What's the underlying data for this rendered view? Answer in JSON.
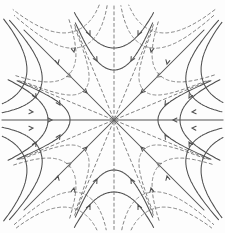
{
  "figure": {
    "name": "saddle-star-phase-portrait",
    "width": 225,
    "height": 233,
    "center": {
      "x": 114,
      "y": 120
    },
    "colors": {
      "background": "#fdfdfd",
      "solid": "#4f4f4f",
      "dashed": "#7b7b7b",
      "axis": "#8a8a8a"
    },
    "stroke": {
      "solid_width": 1.05,
      "dashed_width": 0.95,
      "axis_width": 1.35,
      "dash_pattern": "3,2.8",
      "arrow_len": 4.4,
      "arrow_half_angle": 27
    },
    "clip_box": {
      "x0": 2,
      "y0": 4,
      "x1": 223,
      "y1": 230
    },
    "straight_lines": [
      {
        "name": "horizontal-axis",
        "style": "axis",
        "x1": 2,
        "y1": 120,
        "x2": 223,
        "y2": 120
      },
      {
        "name": "diagonal-ne-sw",
        "style": "solid",
        "x1": 24,
        "y1": 210,
        "x2": 204,
        "y2": 30
      },
      {
        "name": "diagonal-nw-se",
        "style": "solid",
        "x1": 24,
        "y1": 30,
        "x2": 204,
        "y2": 210
      },
      {
        "name": "vertical-axis",
        "style": "dashed",
        "x1": 114,
        "y1": 6,
        "x2": 114,
        "y2": 230
      }
    ],
    "rays": [
      {
        "name": "ray-22p5",
        "angle": 22.5,
        "r": 103,
        "style": "dashed"
      },
      {
        "name": "ray-67p5",
        "angle": 67.5,
        "r": 103,
        "style": "dashed"
      },
      {
        "name": "ray-112p5",
        "angle": 112.5,
        "r": 103,
        "style": "dashed"
      },
      {
        "name": "ray-157p5",
        "angle": 157.5,
        "r": 103,
        "style": "dashed"
      }
    ],
    "span_deg": 22.35,
    "u_curves": [
      {
        "name": "solid-u-top",
        "dir": 90,
        "style": "solid",
        "vertices": [
          50,
          72
        ],
        "clip": 118
      },
      {
        "name": "solid-u-bottom",
        "dir": 270,
        "style": "solid",
        "vertices": [
          50,
          72
        ],
        "clip": 118
      },
      {
        "name": "solid-u-left",
        "dir": 180,
        "style": "solid",
        "vertices": [
          44,
          66
        ],
        "clip": 118
      },
      {
        "name": "solid-u-right",
        "dir": 0,
        "style": "solid",
        "vertices": [
          44,
          66
        ],
        "clip": 118
      },
      {
        "name": "dashed-u-ne",
        "dir": 45,
        "style": "dashed",
        "vertices": [
          42,
          64
        ],
        "clip": 112
      },
      {
        "name": "dashed-u-nw",
        "dir": 135,
        "style": "dashed",
        "vertices": [
          42,
          64
        ],
        "clip": 112
      },
      {
        "name": "dashed-u-sw",
        "dir": 225,
        "style": "dashed",
        "vertices": [
          42,
          64
        ],
        "clip": 112
      },
      {
        "name": "dashed-u-se",
        "dir": 315,
        "style": "dashed",
        "vertices": [
          42,
          64
        ],
        "clip": 112
      },
      {
        "name": "solid-bulge-e-ne",
        "dir": 22.5,
        "style": "solid",
        "vertices": [
          80,
          97
        ],
        "clip": 152
      },
      {
        "name": "solid-bulge-w-nw",
        "dir": 157.5,
        "style": "solid",
        "vertices": [
          80,
          97
        ],
        "clip": 152
      },
      {
        "name": "solid-bulge-w-sw",
        "dir": 202.5,
        "style": "solid",
        "vertices": [
          80,
          97
        ],
        "clip": 152
      },
      {
        "name": "solid-bulge-e-se",
        "dir": 337.5,
        "style": "solid",
        "vertices": [
          80,
          97
        ],
        "clip": 152
      },
      {
        "name": "dashed-bulge-n-ne",
        "dir": 67.5,
        "style": "dashed",
        "vertices": [
          80,
          97
        ],
        "clip": 152
      },
      {
        "name": "dashed-bulge-n-nw",
        "dir": 112.5,
        "style": "dashed",
        "vertices": [
          80,
          97
        ],
        "clip": 152
      },
      {
        "name": "dashed-bulge-s-sw",
        "dir": 247.5,
        "style": "dashed",
        "vertices": [
          80,
          97
        ],
        "clip": 152
      },
      {
        "name": "dashed-bulge-s-se",
        "dir": 292.5,
        "style": "dashed",
        "vertices": [
          80,
          97
        ],
        "clip": 152
      }
    ],
    "arrows": [
      {
        "x": 90,
        "y": 35,
        "a": 63,
        "style": "solid"
      },
      {
        "x": 138,
        "y": 35,
        "a": 117,
        "style": "solid"
      },
      {
        "x": 97,
        "y": 61,
        "a": 60,
        "style": "solid"
      },
      {
        "x": 131,
        "y": 61,
        "a": 120,
        "style": "solid"
      },
      {
        "x": 90,
        "y": 205,
        "a": 297,
        "style": "solid"
      },
      {
        "x": 138,
        "y": 205,
        "a": 243,
        "style": "solid"
      },
      {
        "x": 97,
        "y": 179,
        "a": 300,
        "style": "solid"
      },
      {
        "x": 131,
        "y": 179,
        "a": 240,
        "style": "solid"
      },
      {
        "x": 36,
        "y": 98,
        "a": 61,
        "style": "solid"
      },
      {
        "x": 36,
        "y": 142,
        "a": 299,
        "style": "solid"
      },
      {
        "x": 60,
        "y": 105,
        "a": 58,
        "style": "solid"
      },
      {
        "x": 60,
        "y": 135,
        "a": 302,
        "style": "solid"
      },
      {
        "x": 189,
        "y": 98,
        "a": 119,
        "style": "solid"
      },
      {
        "x": 189,
        "y": 142,
        "a": 241,
        "style": "solid"
      },
      {
        "x": 165,
        "y": 105,
        "a": 122,
        "style": "solid"
      },
      {
        "x": 165,
        "y": 135,
        "a": 238,
        "style": "solid"
      },
      {
        "x": 33,
        "y": 112,
        "a": 4,
        "style": "solid"
      },
      {
        "x": 33,
        "y": 128,
        "a": 356,
        "style": "solid"
      },
      {
        "x": 52,
        "y": 120,
        "a": 0,
        "style": "solid"
      },
      {
        "x": 192,
        "y": 112,
        "a": 176,
        "style": "solid"
      },
      {
        "x": 192,
        "y": 128,
        "a": 184,
        "style": "solid"
      },
      {
        "x": 173,
        "y": 120,
        "a": 180,
        "style": "solid"
      },
      {
        "x": 141,
        "y": 93,
        "a": 135,
        "style": "solid"
      },
      {
        "x": 87,
        "y": 93,
        "a": 45,
        "style": "solid"
      },
      {
        "x": 87,
        "y": 147,
        "a": 315,
        "style": "solid"
      },
      {
        "x": 141,
        "y": 147,
        "a": 225,
        "style": "solid"
      },
      {
        "x": 58,
        "y": 64,
        "a": 78,
        "style": "solid"
      },
      {
        "x": 74,
        "y": 52,
        "a": 78,
        "style": "solid"
      },
      {
        "x": 167,
        "y": 64,
        "a": 102,
        "style": "solid"
      },
      {
        "x": 151,
        "y": 52,
        "a": 102,
        "style": "solid"
      },
      {
        "x": 58,
        "y": 176,
        "a": 282,
        "style": "solid"
      },
      {
        "x": 74,
        "y": 188,
        "a": 282,
        "style": "solid"
      },
      {
        "x": 167,
        "y": 176,
        "a": 258,
        "style": "solid"
      },
      {
        "x": 151,
        "y": 188,
        "a": 258,
        "style": "solid"
      },
      {
        "x": 157,
        "y": 77,
        "a": 145,
        "style": "dashed"
      },
      {
        "x": 71,
        "y": 77,
        "a": 35,
        "style": "dashed"
      },
      {
        "x": 71,
        "y": 163,
        "a": 325,
        "style": "dashed"
      },
      {
        "x": 157,
        "y": 163,
        "a": 215,
        "style": "dashed"
      }
    ]
  }
}
